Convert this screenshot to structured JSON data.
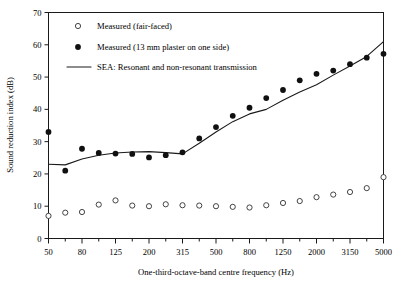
{
  "chart_data": {
    "type": "scatter",
    "title": "",
    "xlabel": "One-third-octave-band centre frequency (Hz)",
    "ylabel": "Sound reduction index (dB)",
    "grid": false,
    "legend_position": "upper-left-inside",
    "ylim": [
      0,
      70
    ],
    "ytick_labels": [
      "0",
      "10",
      "20",
      "30",
      "40",
      "50",
      "60",
      "70"
    ],
    "ytick_values": [
      0,
      10,
      20,
      30,
      40,
      50,
      60,
      70
    ],
    "x_categories": [
      "50",
      "63",
      "80",
      "100",
      "125",
      "160",
      "200",
      "250",
      "315",
      "400",
      "500",
      "630",
      "800",
      "1000",
      "1250",
      "1600",
      "2000",
      "2500",
      "3150",
      "4000",
      "5000"
    ],
    "xtick_labels_shown": [
      "50",
      "80",
      "125",
      "200",
      "315",
      "500",
      "800",
      "1250",
      "2000",
      "3150",
      "5000"
    ],
    "series": [
      {
        "name": "Measured (fair-faced)",
        "marker": "open-circle",
        "values": [
          7.0,
          8.0,
          8.2,
          10.5,
          11.8,
          10.2,
          10.0,
          10.6,
          10.3,
          10.2,
          10.0,
          9.8,
          9.6,
          10.3,
          11.0,
          11.6,
          12.8,
          13.6,
          14.4,
          15.6,
          19.0
        ]
      },
      {
        "name": "Measured (13 mm plaster on one side)",
        "marker": "filled-circle",
        "values": [
          33.0,
          21.0,
          27.8,
          26.5,
          26.3,
          26.2,
          25.1,
          25.8,
          26.7,
          31.0,
          34.5,
          38.0,
          40.5,
          43.5,
          46.0,
          49.0,
          51.0,
          52.0,
          54.0,
          56.0,
          57.2,
          60.0
        ]
      }
    ],
    "line_series": {
      "name": "SEA: Resonant and non-resonant transmission",
      "x_index": [
        0,
        1,
        2,
        3,
        4,
        5,
        6,
        7,
        8,
        9,
        10,
        11,
        12,
        13,
        14,
        15,
        16,
        17,
        18,
        19,
        20
      ],
      "values": [
        23.0,
        22.8,
        24.6,
        25.8,
        26.5,
        26.8,
        26.9,
        26.6,
        26.2,
        29.5,
        33.0,
        36.2,
        38.6,
        40.0,
        42.8,
        45.4,
        47.6,
        50.6,
        53.4,
        56.4,
        61.0
      ]
    }
  },
  "legend": {
    "items": [
      {
        "label": "Measured (fair-faced)",
        "marker": "open-circle"
      },
      {
        "label": "Measured (13 mm plaster on one side)",
        "marker": "filled-circle"
      },
      {
        "label": "SEA: Resonant and non-resonant transmission",
        "marker": "line"
      }
    ]
  },
  "colors": {
    "axis": "#1a1a1a",
    "marker_filled": "#101010",
    "marker_open_stroke": "#303030",
    "line": "#1a1a1a",
    "background": "#ffffff"
  }
}
